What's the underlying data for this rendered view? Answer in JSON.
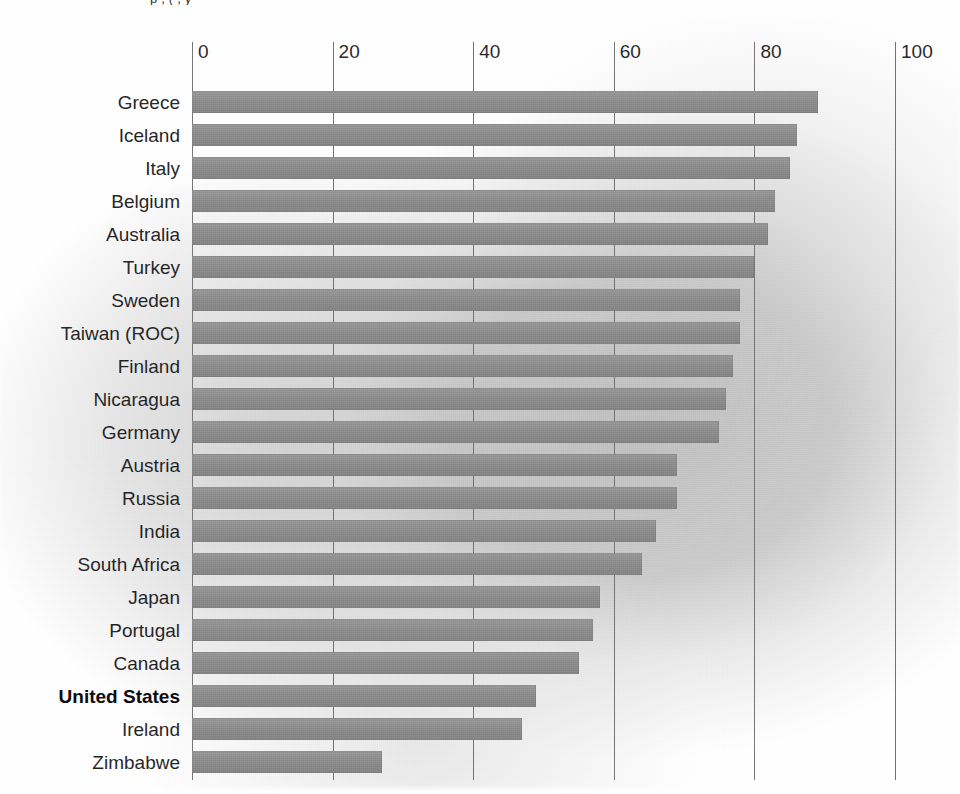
{
  "top_fragment": "p   , (   ,    y",
  "chart_data": {
    "type": "bar",
    "orientation": "horizontal",
    "title": "",
    "subtitle": "",
    "xlabel": "",
    "ylabel": "",
    "xlim": [
      0,
      100
    ],
    "ylim": null,
    "grid": true,
    "legend": null,
    "legend_position": "none",
    "xticks": [
      0,
      20,
      40,
      60,
      80,
      100
    ],
    "xtick_labels": [
      "0",
      "20",
      "40",
      "60",
      "80",
      "100"
    ],
    "highlight_category": "United States",
    "bar_color": "#8b8b8b",
    "gridline_color": "#6e6e6e",
    "text_color": "#1a1a1a",
    "categories": [
      "Greece",
      "Iceland",
      "Italy",
      "Belgium",
      "Australia",
      "Turkey",
      "Sweden",
      "Taiwan (ROC)",
      "Finland",
      "Nicaragua",
      "Germany",
      "Austria",
      "Russia",
      "India",
      "South Africa",
      "Japan",
      "Portugal",
      "Canada",
      "United States",
      "Ireland",
      "Zimbabwe"
    ],
    "values": [
      89,
      86,
      85,
      83,
      82,
      80,
      78,
      78,
      77,
      76,
      75,
      69,
      69,
      66,
      64,
      58,
      57,
      55,
      49,
      47,
      27
    ],
    "bars": [
      {
        "label": "Greece",
        "value": 89,
        "highlight": false
      },
      {
        "label": "Iceland",
        "value": 86,
        "highlight": false
      },
      {
        "label": "Italy",
        "value": 85,
        "highlight": false
      },
      {
        "label": "Belgium",
        "value": 83,
        "highlight": false
      },
      {
        "label": "Australia",
        "value": 82,
        "highlight": false
      },
      {
        "label": "Turkey",
        "value": 80,
        "highlight": false
      },
      {
        "label": "Sweden",
        "value": 78,
        "highlight": false
      },
      {
        "label": "Taiwan (ROC)",
        "value": 78,
        "highlight": false
      },
      {
        "label": "Finland",
        "value": 77,
        "highlight": false
      },
      {
        "label": "Nicaragua",
        "value": 76,
        "highlight": false
      },
      {
        "label": "Germany",
        "value": 75,
        "highlight": false
      },
      {
        "label": "Austria",
        "value": 69,
        "highlight": false
      },
      {
        "label": "Russia",
        "value": 69,
        "highlight": false
      },
      {
        "label": "India",
        "value": 66,
        "highlight": false
      },
      {
        "label": "South Africa",
        "value": 64,
        "highlight": false
      },
      {
        "label": "Japan",
        "value": 58,
        "highlight": false
      },
      {
        "label": "Portugal",
        "value": 57,
        "highlight": false
      },
      {
        "label": "Canada",
        "value": 55,
        "highlight": false
      },
      {
        "label": "United States",
        "value": 49,
        "highlight": true
      },
      {
        "label": "Ireland",
        "value": 47,
        "highlight": false
      },
      {
        "label": "Zimbabwe",
        "value": 27,
        "highlight": false
      }
    ]
  }
}
